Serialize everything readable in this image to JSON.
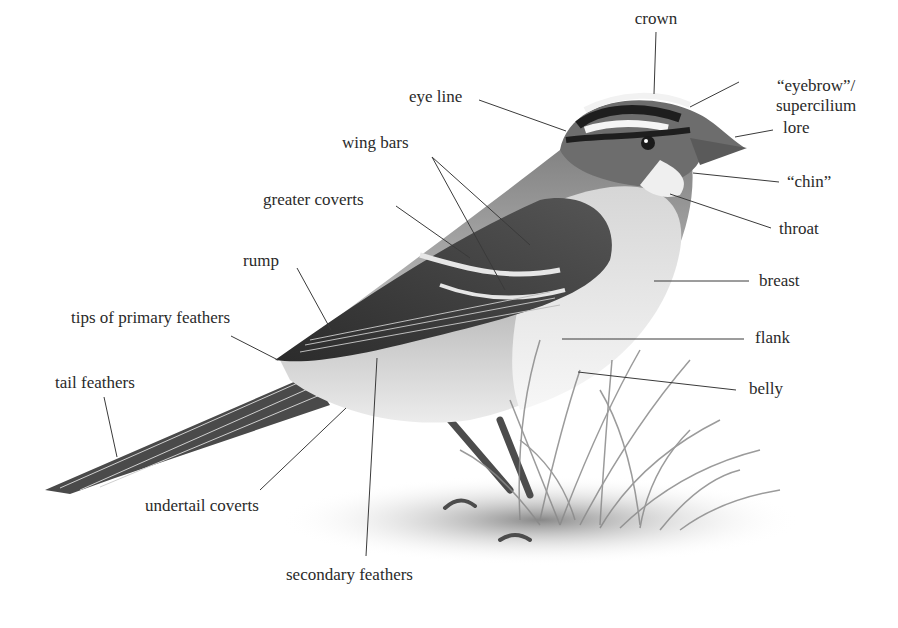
{
  "diagram": {
    "line_color": "#3a3a3a",
    "text_color": "#2a2a2a",
    "labels": [
      {
        "id": "crown",
        "text": "crown",
        "x": 656,
        "y": 9,
        "align": "center",
        "line": [
          656,
          32,
          654,
          94
        ]
      },
      {
        "id": "eyebrow",
        "text": "“eyebrow”/",
        "text2": "supercilium",
        "x": 776,
        "y": 76,
        "align": "left",
        "line": [
          739,
          82,
          690,
          107
        ]
      },
      {
        "id": "eye-line",
        "text": "eye line",
        "x": 409,
        "y": 87,
        "align": "left",
        "line": [
          479,
          100,
          566,
          131
        ]
      },
      {
        "id": "lore",
        "text": "lore",
        "x": 783,
        "y": 118,
        "align": "left",
        "line": [
          773,
          130,
          735,
          137
        ]
      },
      {
        "id": "wing-bars",
        "text": "wing bars",
        "x": 342,
        "y": 133,
        "align": "left",
        "line": [
          432,
          157,
          505,
          290
        ],
        "line2": [
          432,
          157,
          530,
          245
        ]
      },
      {
        "id": "chin",
        "text": "“chin”",
        "x": 787,
        "y": 172,
        "align": "left",
        "line": [
          779,
          182,
          693,
          173
        ]
      },
      {
        "id": "greater-coverts",
        "text": "greater coverts",
        "x": 263,
        "y": 190,
        "align": "left",
        "line": [
          396,
          206,
          470,
          258
        ]
      },
      {
        "id": "throat",
        "text": "throat",
        "x": 779,
        "y": 219,
        "align": "left",
        "line": [
          771,
          228,
          670,
          194
        ]
      },
      {
        "id": "rump",
        "text": "rump",
        "x": 243,
        "y": 251,
        "align": "left",
        "line": [
          297,
          268,
          331,
          330
        ]
      },
      {
        "id": "breast",
        "text": "breast",
        "x": 759,
        "y": 271,
        "align": "left",
        "line": [
          749,
          281,
          654,
          281
        ]
      },
      {
        "id": "tips-of-primary-feathers",
        "text": "tips of primary feathers",
        "x": 71,
        "y": 308,
        "align": "left",
        "line": [
          231,
          336,
          278,
          360
        ]
      },
      {
        "id": "flank",
        "text": "flank",
        "x": 755,
        "y": 328,
        "align": "left",
        "line": [
          744,
          339,
          562,
          339
        ]
      },
      {
        "id": "tail-feathers",
        "text": "tail feathers",
        "x": 55,
        "y": 373,
        "align": "left",
        "line": [
          104,
          397,
          117,
          457
        ]
      },
      {
        "id": "belly",
        "text": "belly",
        "x": 749,
        "y": 379,
        "align": "left",
        "line": [
          736,
          390,
          578,
          372
        ]
      },
      {
        "id": "undertail-coverts",
        "text": "undertail coverts",
        "x": 145,
        "y": 496,
        "align": "left",
        "line": [
          260,
          490,
          346,
          408
        ]
      },
      {
        "id": "secondary-feathers",
        "text": "secondary feathers",
        "x": 286,
        "y": 565,
        "align": "left",
        "line": [
          366,
          556,
          377,
          358
        ]
      }
    ]
  }
}
